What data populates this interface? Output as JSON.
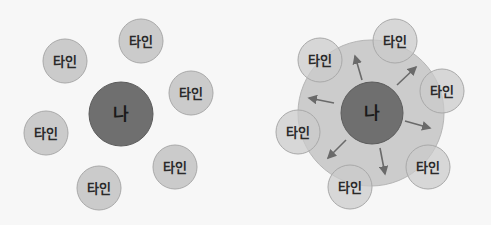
{
  "colors": {
    "background": "#f7f7f7",
    "other_fill": "#cbcbcb",
    "other_stroke": "#a9a9a9",
    "me_fill": "#6f6f6f",
    "me_stroke": "#5c5c5c",
    "influence_fill": "#c4c4c4",
    "arrow": "#6a6a6a"
  },
  "left_diagram": {
    "name": "before",
    "center": {
      "label": "나",
      "cx": 121,
      "cy": 114,
      "r": 32
    },
    "others": [
      {
        "label": "타인",
        "cx": 141,
        "cy": 41,
        "r": 22
      },
      {
        "label": "타인",
        "cx": 65,
        "cy": 61,
        "r": 22
      },
      {
        "label": "타인",
        "cx": 191,
        "cy": 93,
        "r": 22
      },
      {
        "label": "타인",
        "cx": 46,
        "cy": 133,
        "r": 22
      },
      {
        "label": "타인",
        "cx": 175,
        "cy": 167,
        "r": 22
      },
      {
        "label": "타인",
        "cx": 99,
        "cy": 188,
        "r": 22
      }
    ]
  },
  "right_diagram": {
    "name": "after",
    "influence_zone": {
      "cx": 371,
      "cy": 113,
      "r": 73
    },
    "center": {
      "label": "나",
      "cx": 372,
      "cy": 113,
      "r": 31
    },
    "others": [
      {
        "label": "타인",
        "cx": 395,
        "cy": 41,
        "r": 22
      },
      {
        "label": "타인",
        "cx": 320,
        "cy": 60,
        "r": 22
      },
      {
        "label": "타인",
        "cx": 442,
        "cy": 91,
        "r": 22
      },
      {
        "label": "타인",
        "cx": 298,
        "cy": 132,
        "r": 22
      },
      {
        "label": "타인",
        "cx": 428,
        "cy": 167,
        "r": 22
      },
      {
        "label": "타인",
        "cx": 350,
        "cy": 187,
        "r": 22
      }
    ],
    "arrows": [
      {
        "x1": 362,
        "y1": 80,
        "x2": 355,
        "y2": 56
      },
      {
        "x1": 397,
        "y1": 85,
        "x2": 416,
        "y2": 67
      },
      {
        "x1": 405,
        "y1": 121,
        "x2": 430,
        "y2": 128
      },
      {
        "x1": 380,
        "y1": 148,
        "x2": 385,
        "y2": 174
      },
      {
        "x1": 346,
        "y1": 140,
        "x2": 328,
        "y2": 158
      },
      {
        "x1": 334,
        "y1": 103,
        "x2": 309,
        "y2": 98
      }
    ]
  }
}
